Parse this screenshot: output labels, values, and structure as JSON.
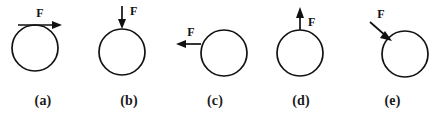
{
  "figure": {
    "type": "physics-force-diagram",
    "width": 441,
    "height": 115,
    "background_color": "#ffffff",
    "stroke_color": "#111111"
  },
  "panels": [
    {
      "id": "a",
      "label": "(a)",
      "force_label": "F",
      "circle": {
        "cx": 35,
        "cy": 48,
        "r": 23
      },
      "arrow": {
        "direction": "right",
        "angle_deg": 0,
        "application_point": "top of circle (tangent)",
        "start": {
          "x": 18,
          "y": 25
        },
        "end": {
          "x": 62,
          "y": 25
        },
        "label_position": {
          "x": 40,
          "y": 16
        }
      }
    },
    {
      "id": "b",
      "label": "(b)",
      "force_label": "F",
      "circle": {
        "cx": 122,
        "cy": 52,
        "r": 23
      },
      "arrow": {
        "direction": "down",
        "angle_deg": 270,
        "application_point": "top of circle",
        "start": {
          "x": 122,
          "y": 6
        },
        "end": {
          "x": 122,
          "y": 29
        },
        "label_position": {
          "x": 130,
          "y": 14
        }
      }
    },
    {
      "id": "c",
      "label": "(c)",
      "force_label": "F",
      "circle": {
        "cx": 224,
        "cy": 53,
        "r": 23
      },
      "arrow": {
        "direction": "left",
        "angle_deg": 180,
        "application_point": "left side of circle (center height)",
        "start": {
          "x": 201,
          "y": 44
        },
        "end": {
          "x": 176,
          "y": 44
        },
        "label_position": {
          "x": 191,
          "y": 36
        }
      }
    },
    {
      "id": "d",
      "label": "(d)",
      "force_label": "F",
      "circle": {
        "cx": 300,
        "cy": 53,
        "r": 23
      },
      "arrow": {
        "direction": "up",
        "angle_deg": 90,
        "application_point": "top of circle",
        "start": {
          "x": 300,
          "y": 30
        },
        "end": {
          "x": 300,
          "y": 8
        },
        "label_position": {
          "x": 308,
          "y": 24
        }
      }
    },
    {
      "id": "e",
      "label": "(e)",
      "force_label": "F",
      "circle": {
        "cx": 405,
        "cy": 54,
        "r": 23
      },
      "arrow": {
        "direction": "down-right",
        "angle_deg": -45,
        "application_point": "upper-left of circle",
        "start": {
          "x": 370,
          "y": 22
        },
        "end": {
          "x": 391,
          "y": 40
        },
        "label_position": {
          "x": 381,
          "y": 17
        }
      }
    }
  ]
}
